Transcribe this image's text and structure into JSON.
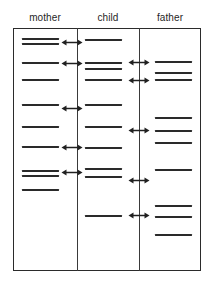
{
  "figure": {
    "columns": [
      {
        "key": "mother",
        "label": "mother"
      },
      {
        "key": "child",
        "label": "child"
      },
      {
        "key": "father",
        "label": "father"
      }
    ],
    "frame": {
      "stroke_color": "#2b2b2b",
      "fill_color": "#ffffff"
    },
    "band_color": "#2a2a2a",
    "arrow_color": "#202020",
    "arrow_icon": "double-headed-horizontal-arrow"
  },
  "chart_data": {
    "type": "table",
    "xlabel": "",
    "ylabel": "",
    "grid": false,
    "legend_position": "none",
    "categories": [
      "mother",
      "child",
      "father"
    ],
    "lanes": [
      {
        "name": "mother",
        "band_count": 10,
        "band_positions_y": [
          39,
          44,
          63,
          80,
          105,
          127,
          147,
          171,
          176,
          190
        ]
      },
      {
        "name": "child",
        "band_count": 10,
        "band_positions_y": [
          40,
          63,
          69,
          80,
          105,
          127,
          148,
          169,
          177,
          216
        ]
      },
      {
        "name": "father",
        "band_count": 10,
        "band_positions_y": [
          62,
          73,
          80,
          118,
          131,
          143,
          170,
          206,
          217,
          235
        ]
      }
    ],
    "match_arrows": [
      {
        "between": "mother-child",
        "positions_y": [
          42,
          63,
          108,
          147,
          172
        ],
        "count": 5
      },
      {
        "between": "child-father",
        "positions_y": [
          62,
          80,
          130,
          180,
          215
        ],
        "count": 5
      }
    ]
  }
}
